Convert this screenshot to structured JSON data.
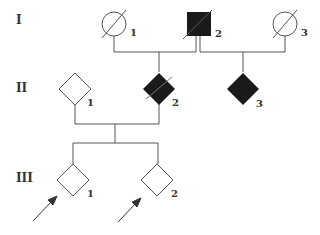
{
  "diagram": {
    "type": "pedigree",
    "generations": [
      {
        "label": "I",
        "members": [
          {
            "id": "1",
            "shape": "circle",
            "affected": false,
            "deceased": true
          },
          {
            "id": "2",
            "shape": "square",
            "affected": true,
            "deceased": true
          },
          {
            "id": "3",
            "shape": "circle",
            "affected": false,
            "deceased": true
          }
        ]
      },
      {
        "label": "II",
        "members": [
          {
            "id": "1",
            "shape": "diamond",
            "affected": false,
            "deceased": false
          },
          {
            "id": "2",
            "shape": "diamond",
            "affected": true,
            "deceased": true
          },
          {
            "id": "3",
            "shape": "diamond",
            "affected": true,
            "deceased": false
          }
        ]
      },
      {
        "label": "III",
        "members": [
          {
            "id": "1",
            "shape": "diamond",
            "affected": false,
            "deceased": false,
            "proband": true
          },
          {
            "id": "2",
            "shape": "diamond",
            "affected": false,
            "deceased": false,
            "proband": true
          }
        ]
      }
    ],
    "colors": {
      "line": "#555555",
      "fill": "#1a1a1a"
    }
  }
}
